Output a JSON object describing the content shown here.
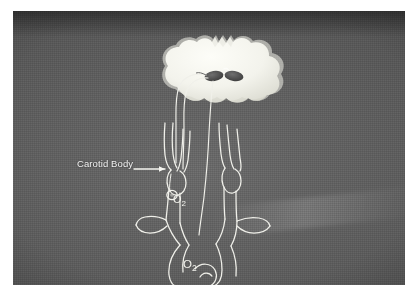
{
  "figure": {
    "medium": "photographed anatomical slide",
    "border_color": "#ffffff",
    "background_color": "#5b5b5b",
    "ink_color": "#f0f0f0"
  },
  "labels": {
    "carotid_body": "Carotid Body",
    "oxygen_carotid": "O",
    "oxygen_carotid_sub": "2",
    "oxygen_aortic": "O",
    "oxygen_aortic_sub": "2"
  },
  "structures": [
    {
      "name": "medulla-oblongata",
      "label": "Medulla / brainstem",
      "fill": "#f5f5f0"
    },
    {
      "name": "brainstem-nucleus-left",
      "label": "Nucleus tractus solitarius (left)",
      "fill": "#4a4a4a"
    },
    {
      "name": "brainstem-nucleus-right",
      "label": "Nucleus tractus solitarius (right)",
      "fill": "#4a4a4a"
    },
    {
      "name": "glossopharyngeal-nerve",
      "label": "Glossopharyngeal nerve (CN IX)"
    },
    {
      "name": "vagus-nerve",
      "label": "Vagus nerve (CN X)"
    },
    {
      "name": "common-carotid-artery-left",
      "label": "Left common carotid artery"
    },
    {
      "name": "common-carotid-artery-right",
      "label": "Right common carotid artery"
    },
    {
      "name": "internal-carotid-artery",
      "label": "Internal carotid artery"
    },
    {
      "name": "external-carotid-artery",
      "label": "External carotid artery"
    },
    {
      "name": "carotid-body",
      "label": "Carotid body"
    },
    {
      "name": "carotid-sinus",
      "label": "Carotid sinus"
    },
    {
      "name": "subclavian-artery",
      "label": "Subclavian artery"
    },
    {
      "name": "aortic-arch",
      "label": "Aortic arch"
    },
    {
      "name": "aortic-body",
      "label": "Aortic body"
    },
    {
      "name": "pulmonary-trunk",
      "label": "Pulmonary trunk"
    },
    {
      "name": "leader-line-carotid-body",
      "label": "Leader line to carotid body"
    }
  ]
}
